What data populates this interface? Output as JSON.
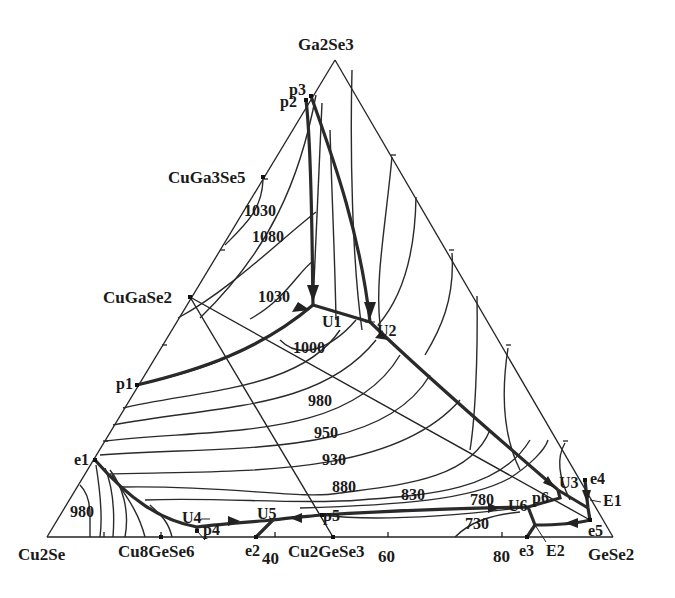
{
  "diagram": {
    "type": "ternary-liquidus-projection",
    "system": "Cu2Se-Ga2Se3-GeSe2",
    "corners": {
      "top": "Ga2Se3",
      "left": "Cu2Se",
      "right": "GeSe2"
    },
    "compounds": {
      "cuga3se5": "CuGa3Se5",
      "cugase2": "CuGaSe2",
      "cu8gese6": "Cu8GeSe6",
      "cu2gese3": "Cu2GeSe3"
    },
    "base_ticks": [
      "40",
      "60",
      "80"
    ],
    "isotherms": {
      "t1030a": "1030",
      "t1080": "1080",
      "t1030b": "1030",
      "t1000": "1000",
      "t980a": "980",
      "t950": "950",
      "t930": "930",
      "t880": "880",
      "t830": "830",
      "t780": "780",
      "t730": "730",
      "t980b": "980"
    },
    "invariant_points": {
      "p1": "p1",
      "p2": "p2",
      "p3": "p3",
      "p4": "p4",
      "p5": "p5",
      "p6": "p6",
      "e1": "e1",
      "e2": "e2",
      "e3": "e3",
      "e4": "e4",
      "e5": "e5",
      "U1": "U1",
      "U2": "U2",
      "U3": "U3",
      "U4": "U4",
      "U5": "U5",
      "U6": "U6",
      "E1": "E1",
      "E2": "E2"
    },
    "colors": {
      "line": "#222222",
      "background": "#ffffff"
    }
  }
}
